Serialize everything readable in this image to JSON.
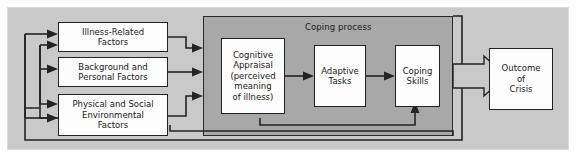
{
  "diagram": {
    "colors": {
      "canvas": "#ffffff",
      "frame_fill": "#c9c9c9",
      "panel_fill": "#a8a8a8",
      "box_fill": "#fdfdfd",
      "stroke": "#232323"
    },
    "panel": {
      "label": "Coping process"
    },
    "input_boxes": [
      {
        "id": "illness-related-factors",
        "lines": [
          "Illness-Related",
          "Factors"
        ]
      },
      {
        "id": "background-and-personal-factors",
        "lines": [
          "Background and",
          "Personal Factors"
        ]
      },
      {
        "id": "physical-and-social-environmental-factors",
        "lines": [
          "Physical and Social",
          "Environmental",
          "Factors"
        ]
      }
    ],
    "process_boxes": [
      {
        "id": "cognitive-appraisal",
        "lines": [
          "Cognitive",
          "Appraisal",
          "(perceived",
          "meaning",
          "of illness)"
        ]
      },
      {
        "id": "adaptive-tasks",
        "lines": [
          "Adaptive",
          "Tasks"
        ]
      },
      {
        "id": "coping-skills",
        "lines": [
          "Coping",
          "Skills"
        ]
      }
    ],
    "output_box": {
      "id": "outcome-of-crisis",
      "lines": [
        "Outcome",
        "of",
        "Crisis"
      ]
    },
    "connections": [
      {
        "from": "illness-related-factors",
        "to": "coping-process",
        "type": "arrow"
      },
      {
        "from": "background-and-personal-factors",
        "to": "coping-process",
        "type": "arrow"
      },
      {
        "from": "physical-and-social-environmental-factors",
        "to": "coping-process",
        "type": "arrow"
      },
      {
        "from": "cognitive-appraisal",
        "to": "adaptive-tasks",
        "type": "arrow"
      },
      {
        "from": "adaptive-tasks",
        "to": "coping-skills",
        "type": "arrow"
      },
      {
        "from": "coping-process",
        "to": "outcome-of-crisis",
        "type": "block-arrow"
      },
      {
        "from": "cognitive-appraisal",
        "to": "coping-skills",
        "type": "feedback-arrow"
      },
      {
        "from": "outcome-of-crisis",
        "to": "illness-related-factors",
        "type": "feedback-arrow"
      },
      {
        "from": "outcome-of-crisis",
        "to": "background-and-personal-factors",
        "type": "feedback-arrow"
      },
      {
        "from": "outcome-of-crisis",
        "to": "physical-and-social-environmental-factors",
        "type": "feedback-arrow"
      }
    ]
  }
}
